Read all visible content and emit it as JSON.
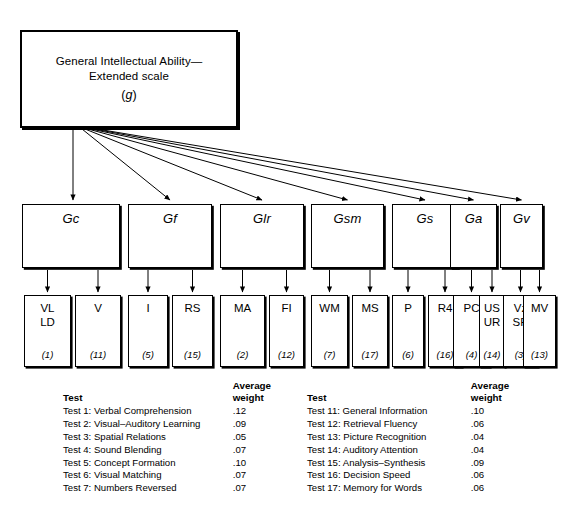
{
  "figure": {
    "g_box": {
      "line1": "General Intellectual Ability—",
      "line2": "Extended scale",
      "symbol": "g",
      "symbol_open": "(",
      "symbol_close": ")"
    },
    "factors": [
      {
        "label": "Gc",
        "x": 22,
        "width": 98
      },
      {
        "label": "Gf",
        "x": 128,
        "width": 84
      },
      {
        "label": "Glr",
        "x": 220,
        "width": 84
      },
      {
        "label": "Gsm",
        "x": 311,
        "width": 73
      },
      {
        "label": "Gs",
        "x": 392,
        "width": 66
      },
      {
        "label": "Ga",
        "x": 450,
        "width": 47
      },
      {
        "label": "Gv",
        "x": 500,
        "width": 43
      }
    ],
    "tests": [
      {
        "code": "VL\nLD",
        "number": "(1)",
        "x": 24,
        "width": 47,
        "factor": "Gc"
      },
      {
        "code": "V",
        "number": "(11)",
        "x": 75,
        "width": 46,
        "factor": "Gc"
      },
      {
        "code": "I",
        "number": "(5)",
        "x": 128,
        "width": 40,
        "factor": "Gf"
      },
      {
        "code": "RS",
        "number": "(15)",
        "x": 172,
        "width": 41,
        "factor": "Gf"
      },
      {
        "code": "MA",
        "number": "(2)",
        "x": 220,
        "width": 45,
        "factor": "Glr"
      },
      {
        "code": "FI",
        "number": "(12)",
        "x": 269,
        "width": 35,
        "factor": "Glr"
      },
      {
        "code": "WM",
        "number": "(7)",
        "x": 311,
        "width": 37,
        "factor": "Gsm"
      },
      {
        "code": "MS",
        "number": "(17)",
        "x": 352,
        "width": 36,
        "factor": "Gsm"
      },
      {
        "code": "P",
        "number": "(6)",
        "x": 392,
        "width": 32,
        "factor": "Gs"
      },
      {
        "code": "R4",
        "number": "(16)",
        "x": 428,
        "width": 34,
        "factor": "Gs"
      },
      {
        "code": "PC",
        "number": "(4)",
        "x": 453,
        "width": 37,
        "factor": "Ga"
      },
      {
        "code": "US\nUR",
        "number": "(14)",
        "x": 479,
        "width": 26,
        "factor": "Ga"
      },
      {
        "code": "Vz\nSR",
        "number": "(3)",
        "x": 503,
        "width": 35,
        "factor": "Gv"
      },
      {
        "code": "MV",
        "number": "(13)",
        "x": 523,
        "width": 33,
        "factor": "Gv"
      }
    ],
    "legend": {
      "header_test": "Test",
      "header_weight_line1": "Average",
      "header_weight_line2": "weight",
      "left_rows": [
        {
          "test": "Test 1: Verbal Comprehension",
          "weight": ".12"
        },
        {
          "test": "Test 2: Visual–Auditory Learning",
          "weight": ".09"
        },
        {
          "test": "Test 3: Spatial Relations",
          "weight": ".05"
        },
        {
          "test": "Test 4: Sound Blending",
          "weight": ".07"
        },
        {
          "test": "Test 5: Concept Formation",
          "weight": ".10"
        },
        {
          "test": "Test 6: Visual Matching",
          "weight": ".07"
        },
        {
          "test": "Test 7: Numbers Reversed",
          "weight": ".07"
        }
      ],
      "right_rows": [
        {
          "test": "Test 11: General Information",
          "weight": ".10"
        },
        {
          "test": "Test 12: Retrieval Fluency",
          "weight": ".06"
        },
        {
          "test": "Test 13: Picture Recognition",
          "weight": ".04"
        },
        {
          "test": "Test 14: Auditory Attention",
          "weight": ".04"
        },
        {
          "test": "Test 15: Analysis–Synthesis",
          "weight": ".09"
        },
        {
          "test": "Test 16: Decision Speed",
          "weight": ".06"
        },
        {
          "test": "Test 17: Memory for Words",
          "weight": ".06"
        }
      ]
    },
    "colors": {
      "stroke": "#000000",
      "background": "#ffffff"
    }
  }
}
